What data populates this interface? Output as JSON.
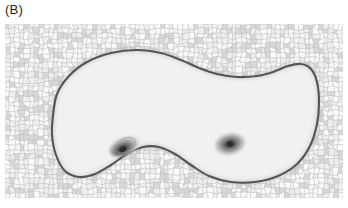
{
  "figure": {
    "panel_label": "(B)",
    "caption_text": "",
    "type": "simulation-field-plot"
  },
  "panel": {
    "x": 5,
    "y": 24,
    "width": 338,
    "height": 174,
    "background_color": "#f2f2f2",
    "border": "none"
  },
  "colors": {
    "page_background": "#ffffff",
    "label_text": "#231f20",
    "mesh_background_fill": "#f4f4f4",
    "mesh_line": "#bcbcbc",
    "mesh_cell_light": "#fafafa",
    "mesh_cell_dark": "#d8d8d8",
    "domain_interior": "#f2f2f2",
    "domain_outline": "#555555",
    "hotspot_core": "#2b2b2b",
    "hotspot_mid": "#8a8a8a",
    "hotspot_outer": "#d5d5d5"
  },
  "chart_data": {
    "type": "heatmap",
    "title": "",
    "subtitle": "",
    "xlabel": "",
    "ylabel": "",
    "grid": false,
    "legend": "none",
    "domain_outline_path_points": [
      [
        48,
        92
      ],
      [
        52,
        70
      ],
      [
        64,
        52
      ],
      [
        82,
        38
      ],
      [
        106,
        29
      ],
      [
        132,
        26
      ],
      [
        156,
        29
      ],
      [
        176,
        36
      ],
      [
        194,
        44
      ],
      [
        212,
        50
      ],
      [
        232,
        53
      ],
      [
        252,
        52
      ],
      [
        268,
        48
      ],
      [
        283,
        42
      ],
      [
        296,
        40
      ],
      [
        306,
        45
      ],
      [
        312,
        58
      ],
      [
        314,
        78
      ],
      [
        312,
        100
      ],
      [
        305,
        122
      ],
      [
        292,
        140
      ],
      [
        273,
        152
      ],
      [
        250,
        158
      ],
      [
        226,
        158
      ],
      [
        204,
        152
      ],
      [
        186,
        141
      ],
      [
        170,
        130
      ],
      [
        154,
        123
      ],
      [
        138,
        123
      ],
      [
        122,
        130
      ],
      [
        106,
        141
      ],
      [
        90,
        150
      ],
      [
        74,
        153
      ],
      [
        60,
        147
      ],
      [
        51,
        131
      ],
      [
        47,
        111
      ]
    ],
    "hotspots": [
      {
        "name": "left-hotspot",
        "cx": 120,
        "cy": 121,
        "rx": 11,
        "ry": 6.5,
        "rotation_deg": -28,
        "core_offset": [
          -4,
          3
        ],
        "peak_intensity": 1.0,
        "shape": "teardrop-elongated"
      },
      {
        "name": "right-hotspot",
        "cx": 225,
        "cy": 120,
        "rx": 10,
        "ry": 7,
        "rotation_deg": -12,
        "core_offset": [
          0,
          0
        ],
        "peak_intensity": 1.0,
        "shape": "ellipse-concentric"
      }
    ],
    "mesh": {
      "style": "unstructured-polygonal",
      "approx_cell_size_px": 5,
      "visible_region": "exterior-of-domain",
      "cols": 70,
      "rows": 36
    },
    "xlim": [
      0,
      338
    ],
    "ylim": [
      0,
      174
    ]
  }
}
